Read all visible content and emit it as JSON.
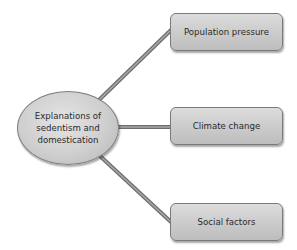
{
  "diagram": {
    "center": {
      "label": "Explanations of sedentism and domestication"
    },
    "branches": [
      {
        "label": "Population pressure"
      },
      {
        "label": "Climate change"
      },
      {
        "label": "Social factors"
      }
    ],
    "colors": {
      "node_fill": "#cfcfcf",
      "node_border": "#7a7a7a",
      "connector": "#8a8a8a",
      "text": "#2a2a2a"
    }
  }
}
